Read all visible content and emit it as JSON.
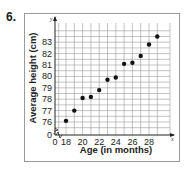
{
  "problem_number": "6.",
  "chart_data": {
    "type": "scatter",
    "title": "",
    "xlabel": "Age (in months)",
    "ylabel": "Average height (cm)",
    "x_axis_name": "x",
    "y_axis_name": "y",
    "x_ticks": [
      "0",
      "18",
      "20",
      "22",
      "24",
      "26",
      "28"
    ],
    "y_ticks": [
      "0",
      "76",
      "77",
      "78",
      "79",
      "80",
      "81",
      "82",
      "83"
    ],
    "xlim": [
      17,
      30
    ],
    "ylim": [
      75.5,
      84
    ],
    "axis_break": true,
    "grid": true,
    "legend": null,
    "x": [
      18,
      19,
      20,
      21,
      22,
      23,
      24,
      25,
      26,
      27,
      28,
      29
    ],
    "y": [
      76.1,
      77.0,
      78.1,
      78.2,
      78.8,
      79.7,
      79.9,
      81.1,
      81.2,
      81.8,
      82.8,
      83.5
    ],
    "colors": {
      "points": "#111111",
      "grid": "#9a9a9a",
      "axis": "#222222",
      "frame": "#9a9a9a"
    }
  }
}
